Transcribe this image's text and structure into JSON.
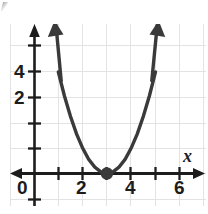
{
  "chart_data": {
    "type": "line",
    "title": "",
    "subtitle": "",
    "xlabel": "x",
    "ylabel": "",
    "xlim": [
      -1,
      7.1
    ],
    "ylim": [
      -1.2,
      6.3
    ],
    "grid": true,
    "grid_step": 1,
    "legend": "none",
    "x_ticks": [
      0,
      1,
      2,
      3,
      4,
      5,
      6
    ],
    "x_tick_labels": [
      "0",
      "",
      "2",
      "",
      "4",
      "",
      "6"
    ],
    "y_ticks": [
      1,
      2,
      3,
      4,
      5
    ],
    "y_tick_labels": [
      "",
      "2",
      "",
      "4",
      ""
    ],
    "series": [
      {
        "name": "parabola",
        "equation": "y = (x - 3)^2",
        "vertex": [
          3,
          0
        ],
        "opens": "up",
        "arrowheads": "both",
        "x": [
          1.0,
          1.25,
          1.5,
          1.75,
          2.0,
          2.25,
          2.5,
          2.75,
          3.0,
          3.25,
          3.5,
          3.75,
          4.0,
          4.25,
          4.5,
          4.75,
          5.0
        ],
        "values": [
          4.0,
          3.0625,
          2.25,
          1.5625,
          1.0,
          0.5625,
          0.25,
          0.0625,
          0.0,
          0.0625,
          0.25,
          0.5625,
          1.0,
          1.5625,
          2.25,
          3.0625,
          4.0
        ]
      }
    ],
    "points": [
      {
        "name": "vertex-point",
        "x": 3,
        "y": 0,
        "style": "filled-dot"
      }
    ]
  },
  "axes": {
    "x_axis_name": "x-axis",
    "y_axis_name": "y-axis",
    "x_label": "x",
    "labels_x": [
      {
        "text": "0",
        "value": 0
      },
      {
        "text": "2",
        "value": 2
      },
      {
        "text": "4",
        "value": 4
      },
      {
        "text": "6",
        "value": 6
      }
    ],
    "labels_y": [
      {
        "text": "2",
        "value": 2
      },
      {
        "text": "4",
        "value": 4
      }
    ]
  },
  "colors": {
    "curve": "#3a3a3a",
    "axis": "#1c1c1c",
    "grid": "#e3e3e3",
    "point": "#3a3a3a",
    "background": "#ffffff",
    "text": "#1c1c1c"
  }
}
